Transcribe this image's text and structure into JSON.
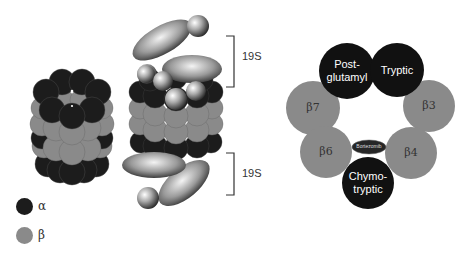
{
  "colors": {
    "alpha": "#1c1c1c",
    "beta": "#8a8a8a",
    "background": "#ffffff",
    "line": "#333333"
  },
  "legend": {
    "items": [
      {
        "symbol": "α",
        "color": "#1c1c1c"
      },
      {
        "symbol": "β",
        "color": "#8a8a8a"
      }
    ]
  },
  "middle": {
    "top_cap_label": "19S",
    "bottom_cap_label": "19S"
  },
  "ring": {
    "subunits": [
      {
        "id": "post-glutamyl",
        "label_line1": "Post-",
        "label_line2": "glutamyl",
        "color": "#111111"
      },
      {
        "id": "tryptic",
        "label_line1": "Tryptic",
        "label_line2": "",
        "color": "#111111"
      },
      {
        "id": "beta3",
        "label_line1": "β3",
        "label_line2": "",
        "color": "#8a8a8a"
      },
      {
        "id": "beta4",
        "label_line1": "β4",
        "label_line2": "",
        "color": "#8a8a8a"
      },
      {
        "id": "chymotryptic",
        "label_line1": "Chymo-",
        "label_line2": "tryptic",
        "color": "#111111"
      },
      {
        "id": "beta6",
        "label_line1": "β6",
        "label_line2": "",
        "color": "#8a8a8a"
      },
      {
        "id": "beta7",
        "label_line1": "β7",
        "label_line2": "",
        "color": "#8a8a8a"
      }
    ],
    "inhibitor_label": "Bortezomib"
  }
}
